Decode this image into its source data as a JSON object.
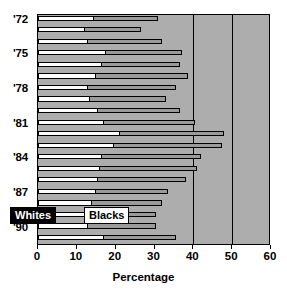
{
  "chart_data": {
    "type": "bar",
    "orientation": "horizontal",
    "title": "",
    "xlabel": "Percentage",
    "ylabel": "",
    "xlim": [
      0,
      60
    ],
    "xticks": [
      0,
      10,
      20,
      30,
      40,
      50,
      60
    ],
    "xticklabels": [
      "0",
      "10",
      "20",
      "30",
      "40",
      "50",
      "60"
    ],
    "gridlines": [
      40,
      50
    ],
    "grid": true,
    "legend_position": "bottom-left-overlay",
    "categories": [
      "'72",
      "'73",
      "'74",
      "'75",
      "'76",
      "'77",
      "'78",
      "'79",
      "'80",
      "'81",
      "'82",
      "'83",
      "'84",
      "'85",
      "'86",
      "'87",
      "'88",
      "'89",
      "'90",
      "'91"
    ],
    "visible_ytick_labels": [
      "'72",
      "'75",
      "'78",
      "'81",
      "'84",
      "'87",
      "'90"
    ],
    "visible_ytick_indices": [
      0,
      3,
      6,
      9,
      12,
      15,
      18
    ],
    "series": [
      {
        "name": "Whites",
        "color": "#fdfdfd",
        "values": [
          14.5,
          12.0,
          13.0,
          17.5,
          16.5,
          15.0,
          13.0,
          13.5,
          15.5,
          17.0,
          21.0,
          19.5,
          16.5,
          16.0,
          15.5,
          15.0,
          14.0,
          13.0,
          13.0,
          17.0
        ]
      },
      {
        "name": "Blacks",
        "color": "#9a9a9a",
        "values": [
          31.0,
          26.5,
          32.0,
          37.0,
          36.5,
          38.5,
          35.5,
          33.0,
          36.5,
          40.5,
          48.0,
          47.5,
          42.0,
          41.0,
          38.0,
          33.5,
          32.0,
          30.5,
          30.5,
          35.5
        ]
      }
    ]
  },
  "legend": {
    "whites_label": "Whites",
    "blacks_label": "Blacks"
  },
  "axis": {
    "x_title": "Percentage"
  }
}
